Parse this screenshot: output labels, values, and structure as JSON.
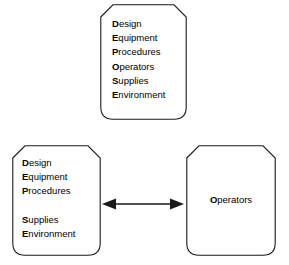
{
  "diagram": {
    "stroke_color": "#1a1a1a",
    "fill_color": "#ffffff",
    "text_color": "#000000",
    "nodes": [
      {
        "id": "all-factors",
        "name": "all-factors-box",
        "shape": "chamfered-top-rounded-bottom-rectangle",
        "lines": [
          {
            "initial": "D",
            "rest": "esign"
          },
          {
            "initial": "E",
            "rest": "quipment"
          },
          {
            "initial": "P",
            "rest": "rocedures"
          },
          {
            "initial": "O",
            "rest": "perators"
          },
          {
            "initial": "S",
            "rest": "upplies"
          },
          {
            "initial": "E",
            "rest": "nvironment"
          }
        ]
      },
      {
        "id": "system-factors",
        "name": "system-factors-box",
        "shape": "chamfered-top-rounded-bottom-rectangle",
        "lines": [
          {
            "initial": "D",
            "rest": "esign"
          },
          {
            "initial": "E",
            "rest": "quipment"
          },
          {
            "initial": "P",
            "rest": "rocedures"
          },
          {
            "initial": "",
            "rest": ""
          },
          {
            "initial": "S",
            "rest": "upplies"
          },
          {
            "initial": "E",
            "rest": "nvironment"
          }
        ]
      },
      {
        "id": "operator-factor",
        "name": "operator-factor-box",
        "shape": "chamfered-top-rounded-bottom-rectangle",
        "lines": [
          {
            "initial": "O",
            "rest": "perators"
          }
        ]
      }
    ],
    "connector": {
      "name": "double-headed-arrow",
      "type": "double-headed-horizontal-arrow",
      "from": "system-factors",
      "to": "operator-factor",
      "label": ""
    }
  }
}
